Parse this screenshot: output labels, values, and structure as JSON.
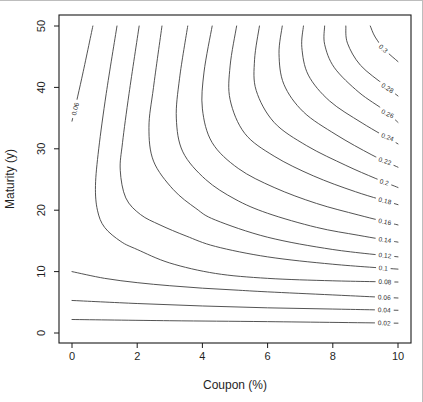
{
  "figure": {
    "width": 423,
    "height": 402,
    "background": "#ffffff",
    "line_color": "#3f3f3f"
  },
  "chart_data": {
    "type": "contour",
    "title": "",
    "xlabel": "Coupon (%)",
    "ylabel": "Maturity (y)",
    "xlim": [
      0,
      10
    ],
    "ylim": [
      0,
      50
    ],
    "x_ticks": [
      "0",
      "2",
      "4",
      "6",
      "8",
      "10"
    ],
    "x_tick_values": [
      0,
      2,
      4,
      6,
      8,
      10
    ],
    "y_ticks": [
      "0",
      "10",
      "20",
      "30",
      "40",
      "50"
    ],
    "y_tick_values": [
      0,
      10,
      20,
      30,
      40,
      50
    ],
    "grid": false,
    "legend": "none",
    "levels": [
      0.02,
      0.04,
      0.06,
      0.08,
      0.1,
      0.12,
      0.14,
      0.16,
      0.18,
      0.2,
      0.22,
      0.24,
      0.26,
      0.28,
      0.3
    ],
    "curves": [
      {
        "level": 0.02,
        "points": [
          [
            0,
            2.2
          ],
          [
            3,
            2.0
          ],
          [
            6,
            1.85
          ],
          [
            10,
            1.6
          ]
        ],
        "label": {
          "text": "0.02",
          "x": 9.58,
          "y": 1.63,
          "rot": 2
        }
      },
      {
        "level": 0.04,
        "points": [
          [
            0,
            5.3
          ],
          [
            2,
            4.8
          ],
          [
            4,
            4.4
          ],
          [
            6,
            4.1
          ],
          [
            8,
            3.9
          ],
          [
            10,
            3.7
          ]
        ],
        "label": {
          "text": "0.04",
          "x": 9.58,
          "y": 3.74,
          "rot": 2
        }
      },
      {
        "level": 0.06,
        "points": [
          [
            0,
            10.0
          ],
          [
            1,
            8.9
          ],
          [
            2,
            8.2
          ],
          [
            3,
            7.7
          ],
          [
            4,
            7.3
          ],
          [
            5,
            7.0
          ],
          [
            6,
            6.7
          ],
          [
            8,
            6.2
          ],
          [
            10,
            5.7
          ]
        ],
        "label": {
          "text": "0.06",
          "x": 9.58,
          "y": 5.8,
          "rot": 3
        }
      },
      {
        "level": 0.06,
        "points": [
          [
            0,
            34.5
          ],
          [
            0.3,
            41.5
          ],
          [
            0.64,
            50
          ]
        ],
        "label": {
          "text": "0.06",
          "x": 0.1,
          "y": 36.5,
          "rot": -77
        }
      },
      {
        "level": 0.08,
        "points": [
          [
            1.38,
            50
          ],
          [
            1.05,
            39
          ],
          [
            0.82,
            30
          ],
          [
            0.72,
            24
          ],
          [
            0.78,
            20
          ],
          [
            1.0,
            17.2
          ],
          [
            1.5,
            14.9
          ],
          [
            2,
            13.6
          ],
          [
            3,
            11.4
          ],
          [
            4.4,
            9.7
          ],
          [
            6,
            8.9
          ],
          [
            8,
            8.5
          ],
          [
            10,
            8.3
          ]
        ],
        "label": {
          "text": "0.08",
          "x": 9.6,
          "y": 8.33,
          "rot": 4
        }
      },
      {
        "level": 0.1,
        "points": [
          [
            2.06,
            50
          ],
          [
            1.75,
            39
          ],
          [
            1.55,
            31
          ],
          [
            1.48,
            26.5
          ],
          [
            1.65,
            22
          ],
          [
            2.1,
            19.3
          ],
          [
            2.7,
            17.6
          ],
          [
            3.5,
            15.8
          ],
          [
            4.4,
            14.1
          ],
          [
            6,
            12.4
          ],
          [
            8,
            11.2
          ],
          [
            10,
            10.4
          ]
        ],
        "label": {
          "text": "0.1",
          "x": 9.55,
          "y": 10.55,
          "rot": 5
        }
      },
      {
        "level": 0.12,
        "points": [
          [
            2.76,
            50
          ],
          [
            2.5,
            40
          ],
          [
            2.36,
            33.5
          ],
          [
            2.5,
            28
          ],
          [
            3.1,
            23.4
          ],
          [
            3.8,
            20.3
          ],
          [
            4.4,
            18.4
          ],
          [
            6,
            15.6
          ],
          [
            8,
            13.6
          ],
          [
            10,
            12.4
          ]
        ],
        "label": {
          "text": "0.12",
          "x": 9.6,
          "y": 12.63,
          "rot": 7
        }
      },
      {
        "level": 0.14,
        "points": [
          [
            3.55,
            50
          ],
          [
            3.3,
            41.5
          ],
          [
            3.2,
            35
          ],
          [
            3.4,
            29.5
          ],
          [
            4.1,
            25
          ],
          [
            5,
            21.8
          ],
          [
            6,
            19.5
          ],
          [
            7.5,
            17.2
          ],
          [
            8.8,
            15.9
          ],
          [
            10,
            14.8
          ]
        ],
        "label": {
          "text": "0.14",
          "x": 9.6,
          "y": 15.16,
          "rot": 9
        }
      },
      {
        "level": 0.16,
        "points": [
          [
            4.3,
            50
          ],
          [
            4.05,
            42.5
          ],
          [
            4.0,
            36.5
          ],
          [
            4.3,
            31
          ],
          [
            5.1,
            26.8
          ],
          [
            6.2,
            23.7
          ],
          [
            7.5,
            21.1
          ],
          [
            8.8,
            19.2
          ],
          [
            10,
            17.6
          ]
        ],
        "label": {
          "text": "0.16",
          "x": 9.6,
          "y": 18.12,
          "rot": 11
        }
      },
      {
        "level": 0.18,
        "points": [
          [
            5.05,
            50
          ],
          [
            4.85,
            43.5
          ],
          [
            4.85,
            38
          ],
          [
            5.3,
            32.5
          ],
          [
            6.2,
            28.8
          ],
          [
            7.4,
            25.6
          ],
          [
            8.7,
            23.0
          ],
          [
            10,
            20.9
          ]
        ],
        "label": {
          "text": "0.18",
          "x": 9.6,
          "y": 21.53,
          "rot": 13
        }
      },
      {
        "level": 0.2,
        "points": [
          [
            5.75,
            50
          ],
          [
            5.6,
            44.5
          ],
          [
            5.65,
            39.5
          ],
          [
            6.2,
            34.3
          ],
          [
            7.2,
            30.5
          ],
          [
            8.4,
            27.3
          ],
          [
            9.3,
            25.2
          ],
          [
            10,
            23.7
          ]
        ],
        "label": {
          "text": "0.2",
          "x": 9.58,
          "y": 24.55,
          "rot": 15
        }
      },
      {
        "level": 0.22,
        "points": [
          [
            6.45,
            50
          ],
          [
            6.35,
            45.5
          ],
          [
            6.5,
            40.5
          ],
          [
            7.1,
            36
          ],
          [
            8.1,
            32.3
          ],
          [
            9.2,
            29.0
          ],
          [
            10,
            27.0
          ]
        ],
        "label": {
          "text": "0.22",
          "x": 9.6,
          "y": 28.0,
          "rot": 18
        }
      },
      {
        "level": 0.24,
        "points": [
          [
            7.1,
            50
          ],
          [
            7.05,
            46.5
          ],
          [
            7.25,
            42
          ],
          [
            7.9,
            37.8
          ],
          [
            8.9,
            34.2
          ],
          [
            10,
            30.8
          ]
        ],
        "label": {
          "text": "0.24",
          "x": 9.68,
          "y": 31.9,
          "rot": 21
        }
      },
      {
        "level": 0.26,
        "points": [
          [
            7.75,
            50
          ],
          [
            7.75,
            47
          ],
          [
            8.05,
            43.2
          ],
          [
            8.8,
            39.2
          ],
          [
            9.6,
            36.2
          ],
          [
            10,
            34.3
          ]
        ],
        "label": {
          "text": "0.26",
          "x": 9.68,
          "y": 35.7,
          "rot": 25
        }
      },
      {
        "level": 0.28,
        "points": [
          [
            8.4,
            50
          ],
          [
            8.45,
            47.2
          ],
          [
            8.85,
            43.6
          ],
          [
            9.6,
            40.3
          ],
          [
            10,
            38.6
          ]
        ],
        "label": {
          "text": "0.28",
          "x": 9.68,
          "y": 39.9,
          "rot": 31
        }
      },
      {
        "level": 0.3,
        "points": [
          [
            9.15,
            50
          ],
          [
            9.3,
            48.2
          ],
          [
            9.6,
            46.1
          ],
          [
            10,
            44.2
          ]
        ],
        "label": {
          "text": "0.3",
          "x": 9.55,
          "y": 46.3,
          "rot": 42
        }
      }
    ],
    "layout": {
      "plot_box_px": {
        "left": 59,
        "top": 15,
        "right": 411,
        "bottom": 343
      },
      "x0_px": 72,
      "x_px_per_unit": 32.6,
      "y0_px": 333,
      "y_px_per_unit": 6.14,
      "tick_length_px": 5
    }
  }
}
